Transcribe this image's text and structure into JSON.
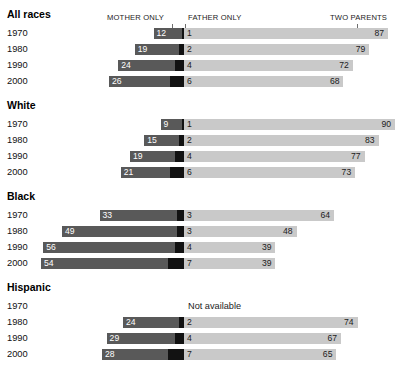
{
  "headers": {
    "mother": "MOTHER ONLY",
    "father": "FATHER ONLY",
    "two": "TWO PARENTS"
  },
  "not_available_label": "Not available",
  "colors": {
    "mother_only": "#595959",
    "father_only": "#121212",
    "two_parents": "#c9c9c9",
    "background": "#ffffff",
    "text": "#111111"
  },
  "chart_data": {
    "type": "bar",
    "title": "",
    "subtype": "diverging stacked bar",
    "xlabel": "",
    "ylabel": "",
    "unit": "percent",
    "xlim": [
      0,
      100
    ],
    "grid": false,
    "legend_position": "top",
    "categories": [
      "1970",
      "1980",
      "1990",
      "2000"
    ],
    "series": [
      {
        "name": "MOTHER ONLY"
      },
      {
        "name": "FATHER ONLY"
      },
      {
        "name": "TWO PARENTS"
      }
    ],
    "groups": [
      {
        "label": "All races",
        "rows": [
          {
            "year": "1970",
            "mother_only": 12,
            "father_only": 1,
            "two_parents": 87,
            "available": true
          },
          {
            "year": "1980",
            "mother_only": 19,
            "father_only": 2,
            "two_parents": 79,
            "available": true
          },
          {
            "year": "1990",
            "mother_only": 24,
            "father_only": 4,
            "two_parents": 72,
            "available": true
          },
          {
            "year": "2000",
            "mother_only": 26,
            "father_only": 6,
            "two_parents": 68,
            "available": true
          }
        ]
      },
      {
        "label": "White",
        "rows": [
          {
            "year": "1970",
            "mother_only": 9,
            "father_only": 1,
            "two_parents": 90,
            "available": true
          },
          {
            "year": "1980",
            "mother_only": 15,
            "father_only": 2,
            "two_parents": 83,
            "available": true
          },
          {
            "year": "1990",
            "mother_only": 19,
            "father_only": 4,
            "two_parents": 77,
            "available": true
          },
          {
            "year": "2000",
            "mother_only": 21,
            "father_only": 6,
            "two_parents": 73,
            "available": true
          }
        ]
      },
      {
        "label": "Black",
        "rows": [
          {
            "year": "1970",
            "mother_only": 33,
            "father_only": 3,
            "two_parents": 64,
            "available": true
          },
          {
            "year": "1980",
            "mother_only": 49,
            "father_only": 3,
            "two_parents": 48,
            "available": true
          },
          {
            "year": "1990",
            "mother_only": 56,
            "father_only": 4,
            "two_parents": 39,
            "available": true
          },
          {
            "year": "2000",
            "mother_only": 54,
            "father_only": 7,
            "two_parents": 39,
            "available": true
          }
        ]
      },
      {
        "label": "Hispanic",
        "rows": [
          {
            "year": "1970",
            "mother_only": null,
            "father_only": null,
            "two_parents": null,
            "available": false
          },
          {
            "year": "1980",
            "mother_only": 24,
            "father_only": 2,
            "two_parents": 74,
            "available": true
          },
          {
            "year": "1990",
            "mother_only": 29,
            "father_only": 4,
            "two_parents": 67,
            "available": true
          },
          {
            "year": "2000",
            "mother_only": 28,
            "father_only": 7,
            "two_parents": 65,
            "available": true
          }
        ]
      }
    ]
  }
}
